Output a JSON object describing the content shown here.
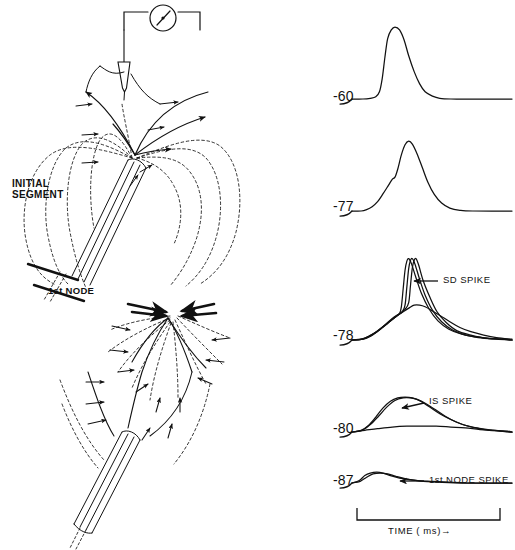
{
  "figure": {
    "title_visible": false,
    "background": "#ffffff",
    "ink": "#111111"
  },
  "diagrams": {
    "upper": {
      "name": "antidromic-invasion-diagram",
      "labels": {
        "initial_segment_line1": "INITIAL",
        "initial_segment_line2": "SEGMENT",
        "first_node": "1st NODE"
      },
      "instrument": {
        "name": "recording-meter",
        "type": "galvanometer-dial"
      },
      "electrode": {
        "name": "micropipette-electrode"
      },
      "current_flow": "outward",
      "field_line_count": 5,
      "arrow_count": 8
    },
    "lower": {
      "name": "soma-dendritic-current-diagram",
      "current_flow": "inward",
      "field_line_count": 9,
      "arrow_count": 14
    }
  },
  "chart_data": {
    "type": "line",
    "title": "",
    "xlabel": "TIME ( ms)",
    "ylabel": "",
    "grid": false,
    "legend_position": "inline-annotations",
    "scalebar": {
      "label": "TIME ( ms)",
      "arrow": "→",
      "x_start_px": 357,
      "x_end_px": 500
    },
    "panels": [
      {
        "name": "trace-panel-60",
        "membrane_potential_mV": -60,
        "label": "-60",
        "annotation": "",
        "trace_count": 1,
        "peak_relative_height": 1.0,
        "description": "full antidromic spike, fast rise, single smooth decay",
        "series": [
          {
            "name": "spike-60",
            "points": [
              [
                0,
                0
              ],
              [
                12,
                0
              ],
              [
                20,
                1
              ],
              [
                26,
                3
              ],
              [
                30,
                10
              ],
              [
                33,
                28
              ],
              [
                36,
                58
              ],
              [
                39,
                84
              ],
              [
                43,
                96
              ],
              [
                47,
                100
              ],
              [
                52,
                96
              ],
              [
                57,
                82
              ],
              [
                62,
                60
              ],
              [
                68,
                38
              ],
              [
                74,
                21
              ],
              [
                80,
                10
              ],
              [
                88,
                4
              ],
              [
                96,
                1
              ],
              [
                108,
                0
              ],
              [
                130,
                0
              ],
              [
                175,
                0
              ]
            ]
          }
        ]
      },
      {
        "name": "trace-panel-77",
        "membrane_potential_mV": -77,
        "label": "-77",
        "annotation": "",
        "trace_count": 1,
        "peak_relative_height": 0.97,
        "description": "spike with prominent IS-SD inflection on rising phase",
        "series": [
          {
            "name": "spike-77",
            "points": [
              [
                0,
                0
              ],
              [
                10,
                0
              ],
              [
                16,
                2
              ],
              [
                22,
                6
              ],
              [
                28,
                13
              ],
              [
                34,
                24
              ],
              [
                40,
                36
              ],
              [
                44,
                44
              ],
              [
                47,
                47
              ],
              [
                50,
                58
              ],
              [
                54,
                78
              ],
              [
                58,
                92
              ],
              [
                62,
                97
              ],
              [
                66,
                93
              ],
              [
                71,
                80
              ],
              [
                77,
                60
              ],
              [
                83,
                40
              ],
              [
                90,
                23
              ],
              [
                98,
                11
              ],
              [
                107,
                4
              ],
              [
                118,
                1
              ],
              [
                132,
                0
              ],
              [
                175,
                0
              ]
            ]
          }
        ]
      },
      {
        "name": "trace-panel-78",
        "membrane_potential_mV": -78,
        "label": "-78",
        "annotation": "SD SPIKE",
        "annotation_arrow": "←",
        "trace_count": 4,
        "peak_relative_height": 0.95,
        "description": "superimposed sweeps: slow IS hump plus abrupt SD spike breaking away at varying latency",
        "series": [
          {
            "name": "sd-sweep-1",
            "points": [
              [
                0,
                0
              ],
              [
                10,
                1
              ],
              [
                18,
                4
              ],
              [
                26,
                9
              ],
              [
                34,
                16
              ],
              [
                42,
                23
              ],
              [
                48,
                28
              ],
              [
                52,
                32
              ],
              [
                54,
                40
              ],
              [
                56,
                62
              ],
              [
                58,
                84
              ],
              [
                60,
                95
              ],
              [
                62,
                98
              ],
              [
                65,
                92
              ],
              [
                70,
                75
              ],
              [
                76,
                56
              ],
              [
                84,
                38
              ],
              [
                94,
                23
              ],
              [
                106,
                13
              ],
              [
                120,
                7
              ],
              [
                138,
                3
              ],
              [
                158,
                1
              ],
              [
                175,
                0
              ]
            ]
          },
          {
            "name": "sd-sweep-2",
            "points": [
              [
                0,
                0
              ],
              [
                11,
                1
              ],
              [
                19,
                5
              ],
              [
                27,
                10
              ],
              [
                35,
                17
              ],
              [
                43,
                24
              ],
              [
                50,
                30
              ],
              [
                55,
                34
              ],
              [
                58,
                42
              ],
              [
                60,
                64
              ],
              [
                62,
                86
              ],
              [
                64,
                96
              ],
              [
                66,
                98
              ],
              [
                69,
                91
              ],
              [
                74,
                73
              ],
              [
                80,
                54
              ],
              [
                88,
                36
              ],
              [
                98,
                22
              ],
              [
                110,
                12
              ],
              [
                124,
                6
              ],
              [
                142,
                3
              ],
              [
                162,
                1
              ],
              [
                175,
                0
              ]
            ]
          },
          {
            "name": "sd-sweep-3",
            "points": [
              [
                0,
                0
              ],
              [
                12,
                1
              ],
              [
                20,
                5
              ],
              [
                28,
                11
              ],
              [
                36,
                18
              ],
              [
                44,
                26
              ],
              [
                52,
                32
              ],
              [
                58,
                37
              ],
              [
                62,
                45
              ],
              [
                64,
                66
              ],
              [
                66,
                87
              ],
              [
                68,
                96
              ],
              [
                70,
                98
              ],
              [
                73,
                90
              ],
              [
                78,
                71
              ],
              [
                85,
                52
              ],
              [
                93,
                34
              ],
              [
                103,
                21
              ],
              [
                115,
                11
              ],
              [
                130,
                6
              ],
              [
                148,
                2
              ],
              [
                166,
                1
              ],
              [
                175,
                0
              ]
            ]
          },
          {
            "name": "sd-sweep-4",
            "points": [
              [
                0,
                0
              ],
              [
                12,
                1
              ],
              [
                21,
                5
              ],
              [
                30,
                12
              ],
              [
                39,
                20
              ],
              [
                48,
                28
              ],
              [
                56,
                34
              ],
              [
                63,
                39
              ],
              [
                68,
                42
              ],
              [
                74,
                42
              ],
              [
                80,
                40
              ],
              [
                88,
                35
              ],
              [
                97,
                29
              ],
              [
                107,
                22
              ],
              [
                118,
                15
              ],
              [
                130,
                10
              ],
              [
                144,
                6
              ],
              [
                158,
                3
              ],
              [
                175,
                1
              ]
            ]
          }
        ]
      },
      {
        "name": "trace-panel-80",
        "membrane_potential_mV": -80,
        "label": "-80",
        "annotation": "IS SPIKE",
        "annotation_arrow": "←",
        "trace_count": 3,
        "peak_relative_height": 0.42,
        "description": "IS spike only, SD invasion blocked; slow residual trace beneath",
        "series": [
          {
            "name": "is-sweep-1",
            "points": [
              [
                0,
                0
              ],
              [
                10,
                2
              ],
              [
                18,
                8
              ],
              [
                26,
                18
              ],
              [
                34,
                29
              ],
              [
                42,
                37
              ],
              [
                50,
                41
              ],
              [
                58,
                42
              ],
              [
                66,
                41
              ],
              [
                75,
                37
              ],
              [
                85,
                30
              ],
              [
                96,
                22
              ],
              [
                108,
                15
              ],
              [
                121,
                9
              ],
              [
                135,
                5
              ],
              [
                150,
                2
              ],
              [
                165,
                1
              ],
              [
                175,
                0
              ]
            ]
          },
          {
            "name": "is-sweep-2",
            "points": [
              [
                0,
                0
              ],
              [
                11,
                2
              ],
              [
                20,
                9
              ],
              [
                29,
                19
              ],
              [
                38,
                30
              ],
              [
                47,
                38
              ],
              [
                56,
                41
              ],
              [
                64,
                41
              ],
              [
                72,
                39
              ],
              [
                81,
                34
              ],
              [
                91,
                27
              ],
              [
                102,
                19
              ],
              [
                114,
                12
              ],
              [
                127,
                7
              ],
              [
                141,
                4
              ],
              [
                156,
                2
              ],
              [
                170,
                0
              ],
              [
                175,
                0
              ]
            ]
          },
          {
            "name": "is-residual",
            "points": [
              [
                0,
                0
              ],
              [
                14,
                2
              ],
              [
                28,
                4
              ],
              [
                44,
                6
              ],
              [
                60,
                7
              ],
              [
                76,
                7
              ],
              [
                92,
                7
              ],
              [
                108,
                6
              ],
              [
                124,
                5
              ],
              [
                140,
                3
              ],
              [
                156,
                2
              ],
              [
                170,
                1
              ],
              [
                175,
                0
              ]
            ]
          }
        ]
      },
      {
        "name": "trace-panel-87",
        "membrane_potential_mV": -87,
        "label": "-87",
        "annotation": "1st NODE SPIKE",
        "annotation_arrow": "←",
        "trace_count": 2,
        "peak_relative_height": 0.13,
        "description": "only the small first-node spike remains; IS invasion blocked",
        "series": [
          {
            "name": "node-sweep-1",
            "points": [
              [
                0,
                0
              ],
              [
                8,
                3
              ],
              [
                14,
                9
              ],
              [
                20,
                12
              ],
              [
                27,
                13
              ],
              [
                34,
                12
              ],
              [
                42,
                9
              ],
              [
                52,
                6
              ],
              [
                64,
                4
              ],
              [
                78,
                2
              ],
              [
                94,
                1
              ],
              [
                112,
                0
              ],
              [
                140,
                0
              ],
              [
                175,
                0
              ]
            ]
          },
          {
            "name": "node-sweep-2",
            "points": [
              [
                0,
                0
              ],
              [
                9,
                2
              ],
              [
                16,
                7
              ],
              [
                23,
                11
              ],
              [
                31,
                12
              ],
              [
                39,
                11
              ],
              [
                48,
                8
              ],
              [
                59,
                5
              ],
              [
                72,
                3
              ],
              [
                88,
                2
              ],
              [
                106,
                1
              ],
              [
                126,
                0
              ],
              [
                175,
                0
              ]
            ]
          }
        ]
      }
    ]
  }
}
